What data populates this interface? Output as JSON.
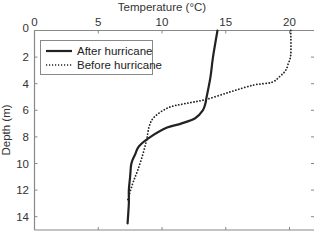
{
  "chart_data": {
    "type": "line",
    "title": "",
    "xlabel": "Temperature (°C)",
    "ylabel": "Depth (m)",
    "xlim": [
      0,
      22
    ],
    "ylim": [
      0,
      15
    ],
    "y_inverted": true,
    "x_axis_position": "top",
    "x_ticks": [
      0,
      5,
      10,
      15,
      20
    ],
    "y_ticks": [
      0,
      2,
      4,
      6,
      8,
      10,
      12,
      14
    ],
    "grid": false,
    "legend_position": "upper left",
    "series": [
      {
        "name": "After hurricane",
        "style": "solid",
        "color": "#222222",
        "points": [
          [
            14.35,
            0
          ],
          [
            14.0,
            2
          ],
          [
            13.8,
            3.5
          ],
          [
            13.5,
            5
          ],
          [
            13.4,
            5.5
          ],
          [
            13.2,
            6
          ],
          [
            12.6,
            6.6
          ],
          [
            11.5,
            7
          ],
          [
            10.4,
            7.3
          ],
          [
            9.1,
            8
          ],
          [
            8.2,
            8.7
          ],
          [
            7.9,
            9.3
          ],
          [
            7.6,
            10
          ],
          [
            7.5,
            11
          ],
          [
            7.4,
            12
          ],
          [
            7.4,
            13
          ],
          [
            7.3,
            14.5
          ]
        ]
      },
      {
        "name": "Before hurricane",
        "style": "dotted",
        "color": "#222222",
        "points": [
          [
            20.1,
            0
          ],
          [
            20.1,
            1.8
          ],
          [
            19.9,
            2.5
          ],
          [
            19.7,
            3
          ],
          [
            19.3,
            3.4
          ],
          [
            18.6,
            3.9
          ],
          [
            17.2,
            4.1
          ],
          [
            15.4,
            4.6
          ],
          [
            13.4,
            5.2
          ],
          [
            11.8,
            5.5
          ],
          [
            10.5,
            5.8
          ],
          [
            9.4,
            6.5
          ],
          [
            9.0,
            7.2
          ],
          [
            8.8,
            8.2
          ],
          [
            8.5,
            9.3
          ],
          [
            8.1,
            10.5
          ],
          [
            7.7,
            11.5
          ],
          [
            7.3,
            12.8
          ]
        ]
      }
    ]
  },
  "labels": {
    "xlabel": "Temperature (°C)",
    "ylabel": "Depth (m)",
    "x_ticks": [
      "0",
      "5",
      "10",
      "15",
      "20"
    ],
    "y_ticks": [
      "0",
      "2",
      "4",
      "6",
      "8",
      "10",
      "12",
      "14"
    ],
    "legend": [
      "After hurricane",
      "Before hurricane"
    ]
  }
}
